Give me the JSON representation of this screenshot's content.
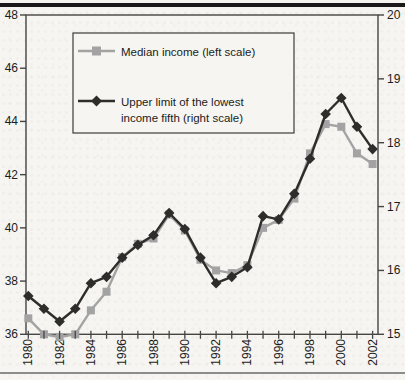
{
  "page": {
    "background": "#f6f5f1",
    "top_rule_color": "#1a1a1a",
    "bottom_rule_color": "#8c8c8c"
  },
  "chart_data": {
    "type": "line",
    "title": "",
    "xlabel": "",
    "ylabel_left": "",
    "ylabel_right": "",
    "x": [
      1980,
      1981,
      1982,
      1983,
      1984,
      1985,
      1986,
      1987,
      1988,
      1989,
      1990,
      1991,
      1992,
      1993,
      1994,
      1995,
      1996,
      1997,
      1998,
      1999,
      2000,
      2001,
      2002
    ],
    "x_labels": [
      "1980",
      "1982",
      "1984",
      "1986",
      "1988",
      "1990",
      "1992",
      "1994",
      "1996",
      "1998",
      "2000",
      "2002"
    ],
    "x_label_every": 2,
    "grid": false,
    "left_axis": {
      "min": 36,
      "max": 48,
      "ticks": [
        48,
        46,
        44,
        42,
        40,
        38,
        36
      ]
    },
    "right_axis": {
      "min": 15,
      "max": 20,
      "ticks": [
        20,
        19,
        18,
        17,
        16,
        15
      ]
    },
    "series": [
      {
        "id": "median",
        "name": "Median income (left scale)",
        "axis": "left",
        "marker": "square",
        "color": "#a3a3a3",
        "values": [
          36.6,
          36.0,
          35.9,
          36.0,
          36.9,
          37.6,
          38.9,
          39.4,
          39.6,
          40.5,
          39.9,
          38.8,
          38.4,
          38.3,
          38.6,
          40.0,
          40.3,
          41.1,
          42.8,
          43.9,
          43.8,
          42.8,
          42.4
        ]
      },
      {
        "id": "upper",
        "name": "Upper limit of the lowest income fifth (right scale)",
        "axis": "right",
        "marker": "diamond",
        "color": "#2e2d2b",
        "values": [
          15.6,
          15.4,
          15.2,
          15.4,
          15.8,
          15.9,
          16.2,
          16.4,
          16.55,
          16.9,
          16.65,
          16.2,
          15.8,
          15.9,
          16.05,
          16.85,
          16.8,
          17.2,
          17.75,
          18.45,
          18.7,
          18.25,
          17.9
        ]
      }
    ],
    "legend": {
      "position": "top-left",
      "entries": [
        {
          "series": "median",
          "lines": [
            "Median income (left scale)"
          ]
        },
        {
          "series": "upper",
          "lines": [
            "Upper limit of the lowest",
            "income fifth (right scale)"
          ]
        }
      ]
    },
    "frame_color": "#454545",
    "text_color": "#1c1c1c"
  }
}
